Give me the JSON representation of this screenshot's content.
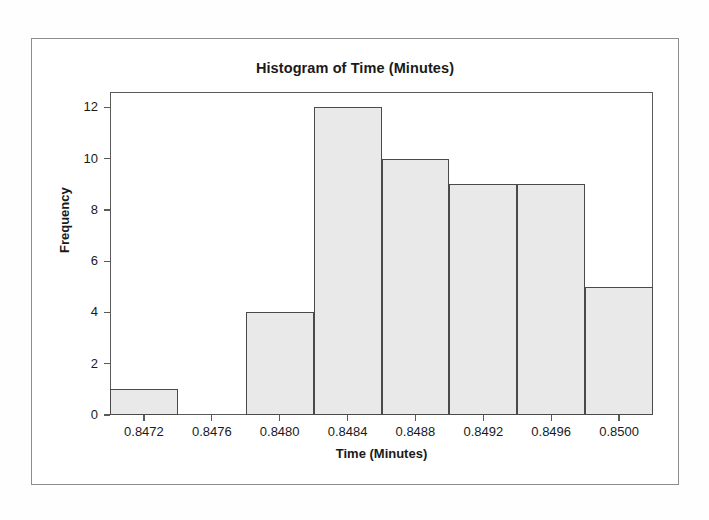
{
  "chart_data": {
    "type": "bar",
    "title": "Histogram of Time (Minutes)",
    "xlabel": "Time (Minutes)",
    "ylabel": "Frequency",
    "grid": false,
    "legend": null,
    "xlim": [
      0.847,
      0.8502
    ],
    "ylim": [
      0,
      12.6
    ],
    "xtick_labels": [
      "0.8472",
      "0.8476",
      "0.8480",
      "0.8484",
      "0.8488",
      "0.8492",
      "0.8496",
      "0.8500"
    ],
    "xtick_values": [
      0.8472,
      0.8476,
      0.848,
      0.8484,
      0.8488,
      0.8492,
      0.8496,
      0.85
    ],
    "ytick_labels": [
      "0",
      "2",
      "4",
      "6",
      "8",
      "10",
      "12"
    ],
    "ytick_values": [
      0,
      2,
      4,
      6,
      8,
      10,
      12
    ],
    "bin_width": 0.0004,
    "bin_edges": [
      0.847,
      0.8474,
      0.8478,
      0.8482,
      0.8486,
      0.849,
      0.8494,
      0.8498,
      0.8502
    ],
    "bin_centers": [
      0.8472,
      0.8476,
      0.848,
      0.8484,
      0.8488,
      0.8492,
      0.8496,
      0.85
    ],
    "categories": [
      "0.8472",
      "0.8476",
      "0.8480",
      "0.8484",
      "0.8488",
      "0.8492",
      "0.8496",
      "0.8500"
    ],
    "values": [
      1,
      0,
      4,
      12,
      10,
      9,
      9,
      5
    ],
    "total_count": 50,
    "colors": {
      "bar_fill": "#e9e9e9",
      "bar_edge": "#4a4a4a",
      "axis": "#5a5a5a",
      "text": "#1a1a1a",
      "frame": "#8d8d8d",
      "background": "#ffffff"
    }
  }
}
